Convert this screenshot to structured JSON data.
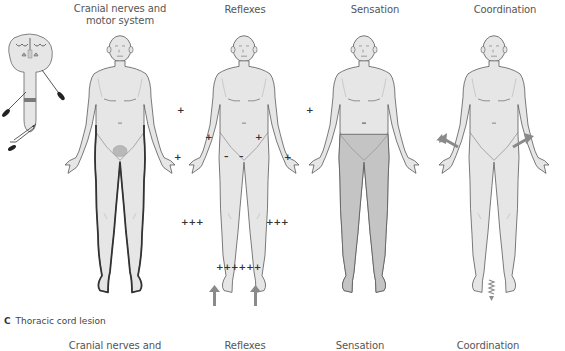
{
  "top_panel": {
    "columns": [
      {
        "id": "motor",
        "title_line1": "Cranial nerves and",
        "title_line2": "motor system"
      },
      {
        "id": "reflexes",
        "title_line1": "Reflexes",
        "title_line2": ""
      },
      {
        "id": "sensation",
        "title_line1": "Sensation",
        "title_line2": ""
      },
      {
        "id": "coordination",
        "title_line1": "Coordination",
        "title_line2": ""
      }
    ],
    "reflex_markers": {
      "upper_plus": "+",
      "abdominal_minus": "–",
      "knee": "+++",
      "ankle": "++++++"
    }
  },
  "panel_c": {
    "letter": "C",
    "caption": "Thoracic cord lesion",
    "columns": [
      {
        "id": "motor",
        "title": "Cranial nerves and"
      },
      {
        "id": "reflexes",
        "title": "Reflexes"
      },
      {
        "id": "sensation",
        "title": "Sensation"
      },
      {
        "id": "coordination",
        "title": "Coordination"
      }
    ]
  },
  "colors": {
    "body_fill": "#e6e6e6",
    "body_outline": "#555555",
    "motor_outline": "#3a3a3a",
    "bladder_fill": "#b8b8b8",
    "sensation_shade": "#c4c4c4",
    "cord_lesion_band": "#7a7a7a",
    "arrow": "#8a8a8a"
  }
}
